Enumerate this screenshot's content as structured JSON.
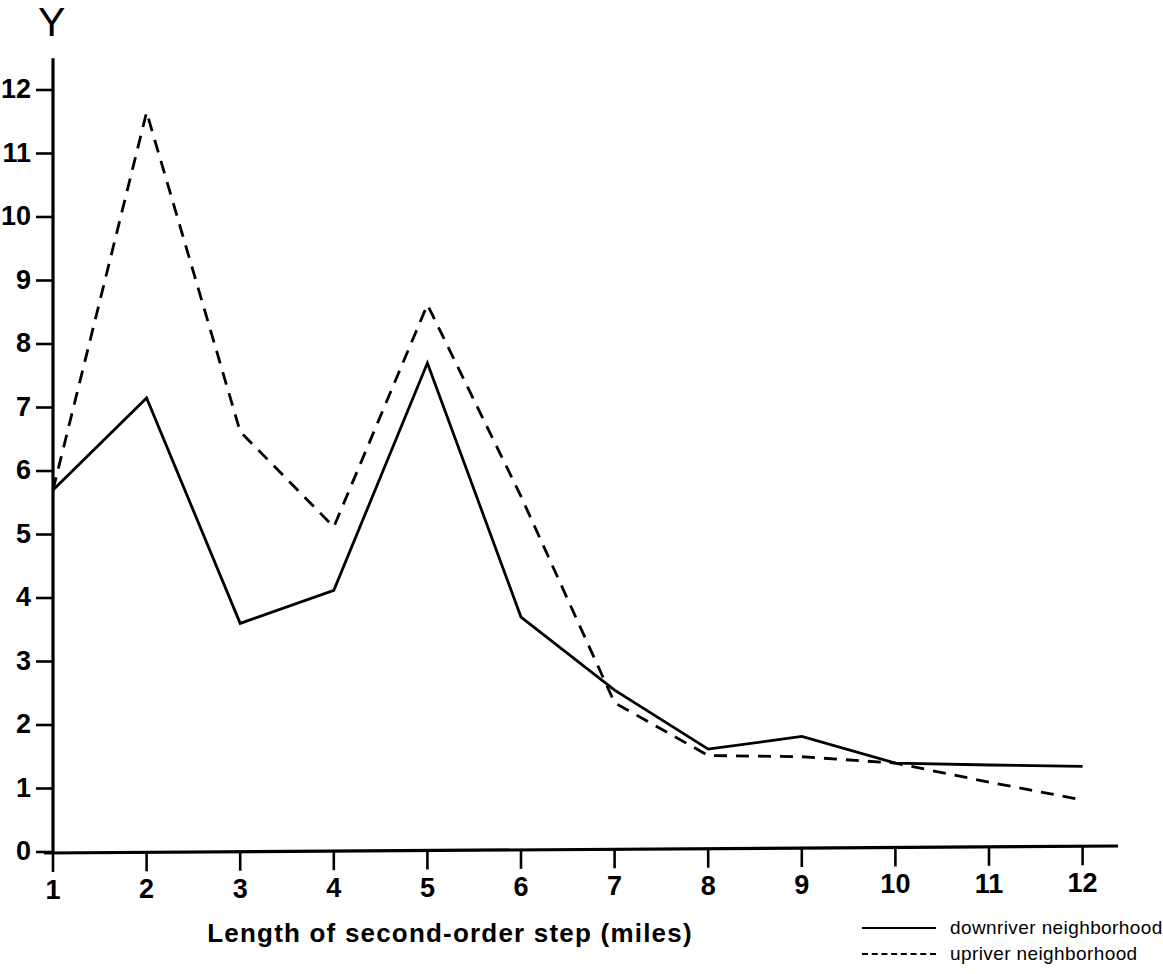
{
  "chart_data": {
    "type": "line",
    "title": "",
    "xlabel": "Length of second-order step (miles)",
    "ylabel": "Y",
    "x": [
      1,
      2,
      3,
      4,
      5,
      6,
      7,
      8,
      9,
      10,
      11,
      12
    ],
    "xtick_labels": [
      "1",
      "2",
      "3",
      "4",
      "5",
      "6",
      "7",
      "8",
      "9",
      "10",
      "11",
      "12"
    ],
    "ytick_labels": [
      "0",
      "1",
      "2",
      "3",
      "4",
      "5",
      "6",
      "7",
      "8",
      "9",
      "10",
      "11",
      "12"
    ],
    "ytick_values": [
      0,
      1,
      2,
      3,
      4,
      5,
      6,
      7,
      8,
      9,
      10,
      11,
      12
    ],
    "xlim": [
      1,
      12
    ],
    "ylim": [
      0,
      12.5
    ],
    "grid": false,
    "legend_position": "bottom-right",
    "series": [
      {
        "name": "downriver neighborhood",
        "style": "solid",
        "color": "#000000",
        "values": [
          5.7,
          7.15,
          3.6,
          4.12,
          7.7,
          3.7,
          2.55,
          1.62,
          1.82,
          1.4,
          1.37,
          1.35
        ]
      },
      {
        "name": "upriver neighborhood",
        "style": "dashed",
        "color": "#000000",
        "values": [
          5.7,
          11.65,
          6.62,
          5.12,
          8.62,
          5.6,
          2.35,
          1.52,
          1.5,
          1.4,
          1.1,
          0.82
        ]
      }
    ]
  },
  "axes": {
    "y_axis_title": "Y",
    "x_axis_title": "Length of second-order step (miles)"
  },
  "legend": {
    "items": [
      {
        "label": "downriver neighborhood",
        "style": "solid"
      },
      {
        "label": "upriver neighborhood",
        "style": "dashed"
      }
    ]
  }
}
